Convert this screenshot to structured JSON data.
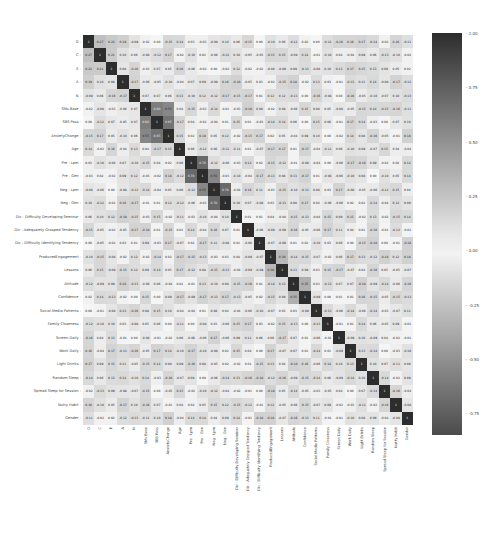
{
  "chart_data": {
    "type": "heatmap",
    "title": "",
    "xlabel": "",
    "ylabel": "",
    "labels": [
      "O",
      "C",
      "E",
      "A",
      "N",
      "SMs Base",
      "SBS Pass",
      "AnxietyChange",
      "Age",
      "Pre : Lpm",
      "Pre : Gen",
      "Neg : Lpm",
      "Neg : Gen",
      "Dic : Difficulty Developing Seminar",
      "Dic : Adequately Grasped Tendency",
      "Dic : Difficulty Identifying Tendency",
      "ProducedEngagement",
      "Lessons",
      "Attitude",
      "Confidence",
      "Social Media Patterns",
      "Family Closeness",
      "Screen Daily",
      "Work Daily",
      "Light Drinks",
      "Random Sleep",
      "Spread Sleep for Session",
      "Nutty Habit",
      "Gender"
    ],
    "value_range": [
      -0.85,
      1.0
    ],
    "colorbar": {
      "ticks": [
        1.0,
        0.75,
        0.5,
        0.25,
        0.0,
        -0.25,
        -0.5,
        -0.75
      ],
      "tick_labels": [
        "1.00",
        "0.75",
        "0.50",
        "0.25",
        "0.00",
        "-0.25",
        "-0.50",
        "-0.75"
      ],
      "colormap": "diverging grayscale (dark at extremes, light near 0)"
    },
    "annotated": true,
    "highlights": [
      {
        "row": "O",
        "col": "C",
        "value": 0.27
      },
      {
        "row": "O",
        "col": "E",
        "value": 0.22
      },
      {
        "row": "O",
        "col": "A",
        "value": 0.19
      },
      {
        "row": "C",
        "col": "E",
        "value": 0.21
      },
      {
        "row": "C",
        "col": "A",
        "value": 0.1
      },
      {
        "row": "E",
        "col": "A",
        "value": 0.08
      },
      {
        "row": "SMs Base",
        "col": "SBS Pass",
        "value": 0.6
      },
      {
        "row": "SMs Base",
        "col": "AnxietyChange",
        "value": 0.55
      },
      {
        "row": "SBS Pass",
        "col": "AnxietyChange",
        "value": 0.65
      },
      {
        "row": "Pre : Lpm",
        "col": "Pre : Gen",
        "value": 0.7
      },
      {
        "row": "Neg : Lpm",
        "col": "Neg : Gen",
        "value": 0.7
      },
      {
        "row": "Pre : Gen",
        "col": "Neg : Lpm",
        "value": 0.55
      },
      {
        "row": "ProducedEngagement",
        "col": "Lessons",
        "value": 0.3
      },
      {
        "row": "Attitude",
        "col": "Confidence",
        "value": 0.35
      }
    ]
  }
}
